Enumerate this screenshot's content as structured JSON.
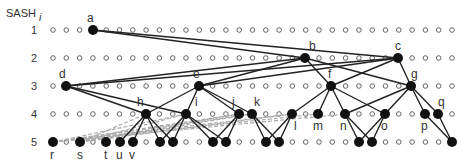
{
  "title": {
    "text": "SASH",
    "subscript": "i"
  },
  "levels": [
    {
      "label": "1",
      "y": 30
    },
    {
      "label": "2",
      "y": 58
    },
    {
      "label": "3",
      "y": 86
    },
    {
      "label": "4",
      "y": 114
    },
    {
      "label": "5",
      "y": 142
    }
  ],
  "grid": {
    "x_start": 53,
    "x_step": 13.3,
    "columns": 31
  },
  "nodes": [
    {
      "id": "a",
      "label": "a",
      "level": 1,
      "x": 93,
      "lx": 87,
      "ly": 22
    },
    {
      "id": "b",
      "label": "b",
      "level": 2,
      "x": 305,
      "lx": 309,
      "ly": 50
    },
    {
      "id": "c",
      "label": "c",
      "level": 2,
      "x": 398,
      "lx": 395,
      "ly": 50
    },
    {
      "id": "d",
      "label": "d",
      "level": 3,
      "x": 66,
      "lx": 59,
      "ly": 78
    },
    {
      "id": "e",
      "label": "e",
      "level": 3,
      "x": 199,
      "lx": 193,
      "ly": 78
    },
    {
      "id": "f",
      "label": "f",
      "level": 3,
      "x": 331,
      "lx": 328,
      "ly": 78
    },
    {
      "id": "g",
      "label": "g",
      "level": 3,
      "x": 411,
      "lx": 411,
      "ly": 78
    },
    {
      "id": "h",
      "label": "h",
      "level": 4,
      "x": 146,
      "lx": 137,
      "ly": 106
    },
    {
      "id": "i",
      "label": "i",
      "level": 4,
      "x": 186,
      "lx": 195,
      "ly": 106
    },
    {
      "id": "j",
      "label": "j",
      "level": 4,
      "x": 239,
      "lx": 232,
      "ly": 106
    },
    {
      "id": "k",
      "label": "k",
      "level": 4,
      "x": 252,
      "lx": 254,
      "ly": 106
    },
    {
      "id": "l",
      "label": "l",
      "level": 4,
      "x": 292,
      "lx": 294,
      "ly": 130
    },
    {
      "id": "m",
      "label": "m",
      "level": 4,
      "x": 318,
      "lx": 313,
      "ly": 130
    },
    {
      "id": "n",
      "label": "n",
      "level": 4,
      "x": 345,
      "lx": 340,
      "ly": 130
    },
    {
      "id": "o",
      "label": "o",
      "level": 4,
      "x": 385,
      "lx": 381,
      "ly": 130
    },
    {
      "id": "p",
      "label": "p",
      "level": 4,
      "x": 425,
      "lx": 421,
      "ly": 130
    },
    {
      "id": "q",
      "label": "q",
      "level": 4,
      "x": 438,
      "lx": 438,
      "ly": 106
    },
    {
      "id": "r",
      "label": "r",
      "level": 5,
      "x": 53,
      "lx": 50,
      "ly": 159
    },
    {
      "id": "s",
      "label": "s",
      "level": 5,
      "x": 80,
      "lx": 77,
      "ly": 159
    },
    {
      "id": "t",
      "label": "t",
      "level": 5,
      "x": 106,
      "lx": 104,
      "ly": 159
    },
    {
      "id": "u",
      "label": "u",
      "level": 5,
      "x": 120,
      "lx": 116,
      "ly": 159
    },
    {
      "id": "v",
      "label": "v",
      "level": 5,
      "x": 133,
      "lx": 129,
      "ly": 159
    },
    {
      "id": "w1",
      "label": "",
      "level": 5,
      "x": 160
    },
    {
      "id": "w2",
      "label": "",
      "level": 5,
      "x": 173
    },
    {
      "id": "w3",
      "label": "",
      "level": 5,
      "x": 213
    },
    {
      "id": "w4",
      "label": "",
      "level": 5,
      "x": 226
    },
    {
      "id": "w5",
      "label": "",
      "level": 5,
      "x": 266
    },
    {
      "id": "w6",
      "label": "",
      "level": 5,
      "x": 279
    },
    {
      "id": "w7",
      "label": "",
      "level": 5,
      "x": 359
    },
    {
      "id": "w8",
      "label": "",
      "level": 5,
      "x": 372
    },
    {
      "id": "w9",
      "label": "",
      "level": 5,
      "x": 452
    }
  ],
  "edges": [
    [
      "a",
      "b"
    ],
    [
      "a",
      "c"
    ],
    [
      "b",
      "d"
    ],
    [
      "b",
      "e"
    ],
    [
      "b",
      "f"
    ],
    [
      "b",
      "g"
    ],
    [
      "c",
      "d"
    ],
    [
      "c",
      "e"
    ],
    [
      "c",
      "f"
    ],
    [
      "c",
      "g"
    ],
    [
      "d",
      "h"
    ],
    [
      "d",
      "i"
    ],
    [
      "e",
      "h"
    ],
    [
      "e",
      "i"
    ],
    [
      "e",
      "j"
    ],
    [
      "e",
      "k"
    ],
    [
      "f",
      "l"
    ],
    [
      "f",
      "m"
    ],
    [
      "f",
      "n"
    ],
    [
      "f",
      "o"
    ],
    [
      "g",
      "n"
    ],
    [
      "g",
      "o"
    ],
    [
      "g",
      "p"
    ],
    [
      "g",
      "q"
    ],
    [
      "h",
      "u"
    ],
    [
      "h",
      "v"
    ],
    [
      "h",
      "w1"
    ],
    [
      "h",
      "w2"
    ],
    [
      "i",
      "w1"
    ],
    [
      "i",
      "w2"
    ],
    [
      "i",
      "w3"
    ],
    [
      "i",
      "w4"
    ],
    [
      "j",
      "w3"
    ],
    [
      "j",
      "w4"
    ],
    [
      "k",
      "w5"
    ],
    [
      "k",
      "w6"
    ],
    [
      "l",
      "w5"
    ],
    [
      "l",
      "w6"
    ],
    [
      "n",
      "w7"
    ],
    [
      "n",
      "w8"
    ],
    [
      "o",
      "w7"
    ],
    [
      "o",
      "w8"
    ],
    [
      "p",
      "w9"
    ],
    [
      "q",
      "w9"
    ]
  ],
  "dashed_edges": [
    [
      "r",
      "i"
    ],
    [
      "r",
      "j"
    ],
    [
      "r",
      "k"
    ],
    [
      "r",
      "l"
    ],
    [
      "r",
      "m"
    ],
    [
      "r",
      "n"
    ],
    [
      "s",
      "h"
    ],
    [
      "s",
      "i"
    ],
    [
      "s",
      "j"
    ],
    [
      "s",
      "k"
    ],
    [
      "s",
      "l"
    ]
  ],
  "colors": {
    "node": "#111111",
    "edge": "#222222",
    "dashed": "#aaaaaa",
    "empty": "#555555",
    "text": "#333333"
  }
}
